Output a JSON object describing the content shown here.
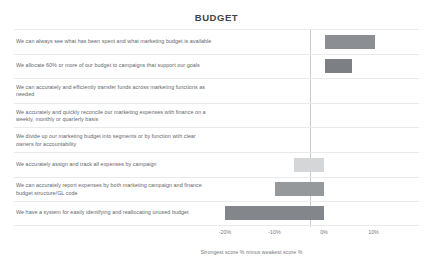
{
  "chart_data": {
    "type": "bar",
    "orientation": "horizontal",
    "title": "BUDGET",
    "xlabel": "Strongest score % minus weakest score %",
    "ylabel": "",
    "xlim": [
      -23,
      13
    ],
    "grid": false,
    "legend": "none",
    "zero_line": true,
    "tick_labels": [
      "-20%",
      "-10%",
      "0%",
      "10%"
    ],
    "tick_values": [
      -20,
      -10,
      0,
      10
    ],
    "categories": [
      "We can always see what has been spent and what marketing budget is available",
      "We allocate 60% or more of our budget to campaigns that support our goals",
      "We can accurately and efficiently transfer funds across marketing functions as needed",
      "We accurately and quickly reconcile our marketing expenses with finance on a weekly, monthly or quarterly basis",
      "We divide up our marketing budget into segments or by function with clear owners for accountability",
      "We accurately assign and track all expenses by campaign",
      "We can accurately report expenses by both marketing campaign and finance budget structure/GL code",
      "We have a system for easily identifying and reallocating unused budget"
    ],
    "values": [
      10,
      5.5,
      0,
      0,
      0,
      -6,
      -10,
      -20
    ],
    "bar_colors": [
      "#8b8f93",
      "#7c8084",
      "#ffffff",
      "#ffffff",
      "#ffffff",
      "#d4d6d8",
      "#96999c",
      "#83878b"
    ]
  },
  "title": {
    "text": "BUDGET"
  },
  "axis": {
    "caption": "Strongest score % minus weakest score %",
    "ticks": [
      {
        "label": "-20%"
      },
      {
        "label": "-10%"
      },
      {
        "label": "0%"
      },
      {
        "label": "10%"
      }
    ]
  },
  "rows": [
    {
      "label": "We can always see what has been spent and what marketing budget is available"
    },
    {
      "label": "We allocate 60% or more of our budget to campaigns that support our goals"
    },
    {
      "label": "We can accurately and efficiently transfer funds across marketing functions as needed"
    },
    {
      "label": "We accurately and quickly reconcile our marketing expenses with finance on a weekly, monthly or quarterly basis"
    },
    {
      "label": "We divide up our marketing budget into segments or by function with clear owners for accountability"
    },
    {
      "label": "We accurately assign and track all expenses by campaign"
    },
    {
      "label": "We can accurately report expenses by both marketing campaign and finance budget structure/GL code"
    },
    {
      "label": "We have a system for easily identifying and reallocating unused budget"
    }
  ]
}
